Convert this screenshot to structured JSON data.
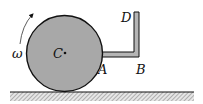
{
  "diagram": {
    "labels": {
      "omega": "ω",
      "center": "C",
      "point_a": "A",
      "point_b": "B",
      "point_d": "D"
    },
    "colors": {
      "disk_fill": "#a8a8a8",
      "stroke": "#111111",
      "rod_fill": "#b0b0b0",
      "ground_hatch": "#888888"
    }
  }
}
